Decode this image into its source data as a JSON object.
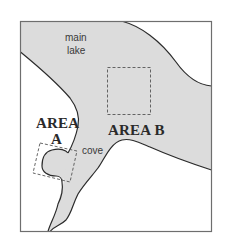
{
  "figure": {
    "type": "schematic-map",
    "colors": {
      "water": "#dcdcdc",
      "land": "#ffffff",
      "shoreline": "#2b2b2b",
      "frame": "#6e6e6e",
      "study_box": "#555555"
    }
  },
  "labels": {
    "main_lake_line1": "main",
    "main_lake_line2": "lake",
    "area_a_line1": "AREA",
    "area_a_line2": "A",
    "area_b": "AREA B",
    "cove": "cove"
  },
  "regions": [
    {
      "name": "main lake",
      "kind": "water"
    },
    {
      "name": "cove",
      "kind": "water"
    },
    {
      "name": "AREA A",
      "kind": "study-area",
      "box_style": "dashed",
      "rotated": true
    },
    {
      "name": "AREA B",
      "kind": "study-area",
      "box_style": "dashed",
      "rotated": false
    }
  ]
}
